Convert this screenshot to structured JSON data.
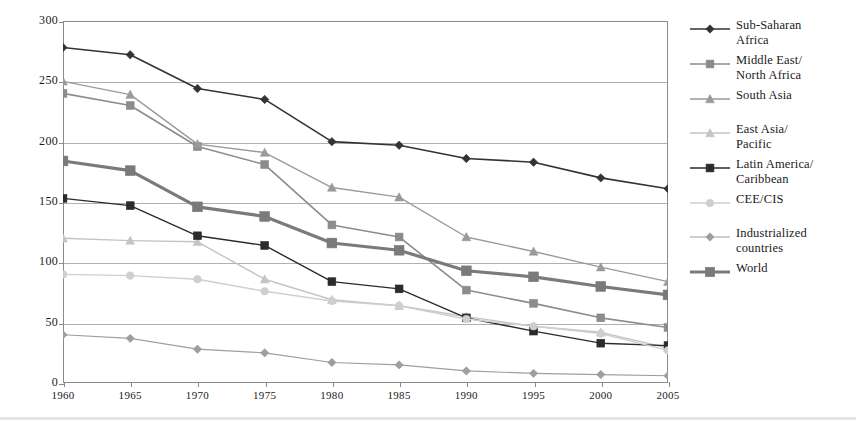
{
  "chart_data": {
    "type": "line",
    "title": "",
    "xlabel": "",
    "ylabel": "",
    "x": [
      1960,
      1965,
      1970,
      1975,
      1980,
      1985,
      1990,
      1995,
      2000,
      2005
    ],
    "xlim": [
      1960,
      2005
    ],
    "ylim": [
      0,
      300
    ],
    "yticks": [
      0,
      50,
      100,
      150,
      200,
      250,
      300
    ],
    "xticks": [
      "1960",
      "1965",
      "1970",
      "1975",
      "1980",
      "1985",
      "1990",
      "1995",
      "2000",
      "2005"
    ],
    "grid": true,
    "legend_position": "right",
    "series": [
      {
        "name": "Sub-Saharan\nAfrica",
        "color": "#333333",
        "marker": "diamond",
        "width": 1.6,
        "values": [
          278,
          272,
          244,
          235,
          200,
          197,
          186,
          183,
          170,
          161
        ]
      },
      {
        "name": "Middle East/\nNorth Africa",
        "color": "#8c8c8c",
        "marker": "square",
        "width": 1.6,
        "values": [
          240,
          230,
          196,
          181,
          131,
          121,
          77,
          66,
          54,
          46
        ]
      },
      {
        "name": "South Asia",
        "color": "#9a9a9a",
        "marker": "triangle",
        "width": 1.4,
        "values": [
          250,
          239,
          198,
          191,
          162,
          154,
          121,
          109,
          96,
          84
        ]
      },
      {
        "name": "East Asia/\nPacific",
        "color": "#c4c4c4",
        "marker": "triangle",
        "width": 1.4,
        "values": [
          120,
          118,
          117,
          86,
          69,
          64,
          55,
          47,
          42,
          29
        ]
      },
      {
        "name": "Latin America/\nCaribbean",
        "color": "#2b2b2b",
        "marker": "square-filled",
        "width": 1.4,
        "values": [
          153,
          147,
          122,
          114,
          84,
          78,
          54,
          43,
          33,
          31
        ]
      },
      {
        "name": "CEE/CIS",
        "color": "#cfcfcf",
        "marker": "circle",
        "width": 1.4,
        "values": [
          90,
          89,
          86,
          76,
          68,
          64,
          53,
          47,
          41,
          27
        ]
      },
      {
        "name": "Industrialized\ncountries",
        "color": "#9e9e9e",
        "marker": "diamond",
        "width": 1.2,
        "values": [
          40,
          37,
          28,
          25,
          17,
          15,
          10,
          8,
          7,
          6
        ]
      },
      {
        "name": "World",
        "color": "#7a7a7a",
        "marker": "square",
        "width": 3.2,
        "values": [
          184,
          176,
          146,
          138,
          116,
          110,
          93,
          88,
          80,
          73
        ]
      }
    ]
  },
  "legend": {
    "items": [
      {
        "label": "Sub-Saharan\nAfrica"
      },
      {
        "label": "Middle East/\nNorth Africa"
      },
      {
        "label": "South Asia"
      },
      {
        "label": "East Asia/\nPacific"
      },
      {
        "label": "Latin America/\nCaribbean"
      },
      {
        "label": "CEE/CIS"
      },
      {
        "label": "Industrialized\ncountries"
      },
      {
        "label": "World"
      }
    ]
  }
}
